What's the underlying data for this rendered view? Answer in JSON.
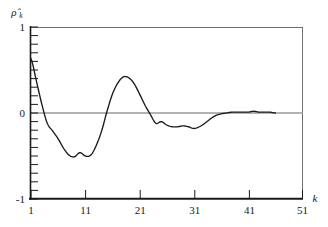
{
  "chart_data": {
    "type": "line",
    "title": "",
    "subtitle": "",
    "xlabel": "k",
    "ylabel": "ρ̂",
    "ylabel_sub": "k",
    "xlim": [
      1,
      51
    ],
    "ylim": [
      -1,
      1
    ],
    "grid": false,
    "legend": null,
    "zero_line": 0,
    "x_ticks": [
      1,
      11,
      21,
      31,
      41,
      51
    ],
    "x_tick_labels": [
      "1",
      "11",
      "21",
      "31",
      "41",
      "51"
    ],
    "y_ticks": [
      -1,
      0,
      1
    ],
    "y_tick_labels": [
      "-1",
      "0",
      "1"
    ],
    "y_minor_tick_step": 0.1,
    "line_color": "#1a1a1a",
    "zero_line_color": "#9a9a9a",
    "frame_color": "#6e6e6e",
    "axis_color": "#1a1a1a",
    "background_color": "#ffffff",
    "series": [
      {
        "name": "sample autocorrelation",
        "x": [
          1,
          2,
          3,
          4,
          5,
          6,
          7,
          8,
          9,
          10,
          11,
          12,
          13,
          14,
          15,
          16,
          17,
          18,
          19,
          20,
          21,
          22,
          23,
          24,
          25,
          26,
          27,
          28,
          29,
          30,
          31,
          32,
          33,
          34,
          35,
          36,
          37,
          38,
          39,
          40,
          41,
          42,
          43,
          44,
          45,
          46
        ],
        "values": [
          0.63,
          0.37,
          0.1,
          -0.12,
          -0.21,
          -0.3,
          -0.41,
          -0.49,
          -0.51,
          -0.46,
          -0.5,
          -0.49,
          -0.38,
          -0.21,
          0.02,
          0.22,
          0.35,
          0.42,
          0.41,
          0.34,
          0.22,
          0.09,
          -0.02,
          -0.12,
          -0.1,
          -0.14,
          -0.16,
          -0.16,
          -0.15,
          -0.16,
          -0.18,
          -0.16,
          -0.12,
          -0.07,
          -0.03,
          -0.01,
          0.0,
          0.01,
          0.01,
          0.01,
          0.01,
          0.02,
          0.01,
          0.01,
          0.01,
          0.0
        ]
      }
    ]
  }
}
